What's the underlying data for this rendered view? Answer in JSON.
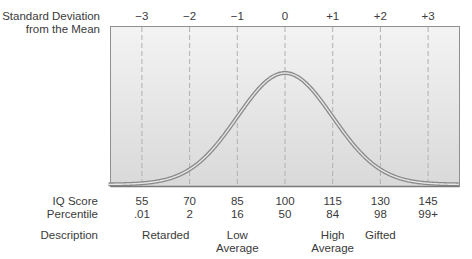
{
  "chart_data": {
    "type": "line",
    "title": "",
    "row_labels": {
      "sd": "Standard Deviation\nfrom the Mean",
      "sd_line1": "Standard Deviation",
      "sd_line2": "from the Mean",
      "iq": "IQ Score",
      "percentile": "Percentile",
      "description": "Description"
    },
    "sd_ticks": [
      "−3",
      "−2",
      "−1",
      "0",
      "+1",
      "+2",
      "+3"
    ],
    "x": [
      -3,
      -2,
      -1,
      0,
      1,
      2,
      3
    ],
    "iq_scores": [
      "55",
      "70",
      "85",
      "100",
      "115",
      "130",
      "145"
    ],
    "percentiles": [
      ".01",
      "2",
      "16",
      "50",
      "84",
      "98",
      "99+"
    ],
    "descriptions": [
      {
        "line1": "Retarded",
        "line2": "",
        "center_sd": -2.5
      },
      {
        "line1": "Low",
        "line2": "Average",
        "center_sd": -1
      },
      {
        "line1": "High",
        "line2": "Average",
        "center_sd": 1
      },
      {
        "line1": "Gifted",
        "line2": "",
        "center_sd": 2
      }
    ],
    "series": [
      {
        "name": "Normal distribution",
        "mean": 0,
        "sd": 1
      }
    ],
    "xlim": [
      -3.7,
      3.65
    ],
    "grid": "vertical dashed at each SD",
    "colors": {
      "curve": "#8a8a8a",
      "curve_inner": "#e8e8e8",
      "grid": "#b0b0b0",
      "frame": "#8f8f8f",
      "bg_top": "#f2f2f2",
      "bg_bottom": "#dcdcdc"
    }
  }
}
